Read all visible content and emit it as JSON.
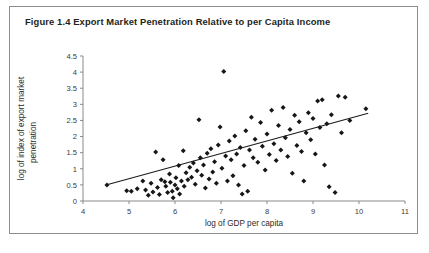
{
  "figure": {
    "title": "Figure 1.4  Export Market Penetration Relative to per Capita Income",
    "border_color": "#8d8d8d",
    "background": "#ffffff"
  },
  "chart_data": {
    "type": "scatter",
    "title": "Export Market Penetration Relative to per Capita Income",
    "xlabel": "log of GDP per capita",
    "ylabel": "log of index of export market penetration",
    "ylabel_line1": "log of index of export market",
    "ylabel_line2": "penetration",
    "xlim": [
      4,
      11
    ],
    "ylim": [
      0,
      4.5
    ],
    "xticks": [
      4,
      5,
      6,
      7,
      8,
      9,
      10,
      11
    ],
    "xtick_labels": [
      "4",
      "5",
      "6",
      "7",
      "8",
      "9",
      "10",
      "11"
    ],
    "yticks": [
      0,
      0.5,
      1,
      1.5,
      2,
      2.5,
      3,
      3.5,
      4,
      4.5
    ],
    "ytick_labels": [
      "0",
      "0.5",
      "1",
      "1.5",
      "2",
      "2.5",
      "3",
      "3.5",
      "4",
      "4.5"
    ],
    "grid": false,
    "legend": null,
    "marker": "diamond",
    "marker_color": "#161616",
    "trendline": {
      "type": "linear-fit",
      "x": [
        4.5,
        10.2
      ],
      "y": [
        0.5,
        2.72
      ],
      "color": "#1b1b1b"
    },
    "points": [
      [
        4.52,
        0.5
      ],
      [
        4.95,
        0.32
      ],
      [
        5.05,
        0.3
      ],
      [
        5.18,
        0.38
      ],
      [
        5.3,
        0.62
      ],
      [
        5.36,
        0.34
      ],
      [
        5.42,
        0.18
      ],
      [
        5.48,
        0.55
      ],
      [
        5.52,
        0.28
      ],
      [
        5.58,
        1.52
      ],
      [
        5.62,
        0.42
      ],
      [
        5.66,
        0.2
      ],
      [
        5.7,
        0.66
      ],
      [
        5.74,
        1.28
      ],
      [
        5.78,
        0.6
      ],
      [
        5.8,
        0.46
      ],
      [
        5.84,
        0.26
      ],
      [
        5.88,
        0.84
      ],
      [
        5.9,
        0.58
      ],
      [
        5.94,
        0.3
      ],
      [
        5.96,
        0.1
      ],
      [
        6.0,
        0.5
      ],
      [
        6.02,
        0.72
      ],
      [
        6.05,
        0.38
      ],
      [
        6.08,
        1.1
      ],
      [
        6.1,
        0.22
      ],
      [
        6.14,
        0.62
      ],
      [
        6.18,
        1.56
      ],
      [
        6.2,
        0.46
      ],
      [
        6.24,
        0.88
      ],
      [
        6.28,
        0.66
      ],
      [
        6.32,
        1.05
      ],
      [
        6.36,
        0.74
      ],
      [
        6.4,
        1.18
      ],
      [
        6.44,
        0.52
      ],
      [
        6.48,
        0.94
      ],
      [
        6.52,
        2.52
      ],
      [
        6.55,
        1.34
      ],
      [
        6.58,
        0.8
      ],
      [
        6.62,
        1.12
      ],
      [
        6.66,
        0.4
      ],
      [
        6.7,
        1.48
      ],
      [
        6.74,
        0.68
      ],
      [
        6.78,
        1.62
      ],
      [
        6.82,
        0.9
      ],
      [
        6.86,
        1.22
      ],
      [
        6.9,
        0.55
      ],
      [
        6.94,
        1.74
      ],
      [
        6.98,
        2.3
      ],
      [
        7.02,
        1.02
      ],
      [
        7.06,
        4.02
      ],
      [
        7.1,
        1.4
      ],
      [
        7.14,
        0.62
      ],
      [
        7.18,
        1.86
      ],
      [
        7.22,
        1.28
      ],
      [
        7.26,
        0.78
      ],
      [
        7.3,
        2.02
      ],
      [
        7.34,
        1.46
      ],
      [
        7.38,
        0.5
      ],
      [
        7.42,
        1.66
      ],
      [
        7.46,
        0.22
      ],
      [
        7.5,
        1.1
      ],
      [
        7.54,
        2.18
      ],
      [
        7.58,
        0.3
      ],
      [
        7.62,
        1.58
      ],
      [
        7.66,
        2.6
      ],
      [
        7.7,
        1.34
      ],
      [
        7.74,
        1.92
      ],
      [
        7.8,
        1.2
      ],
      [
        7.86,
        2.44
      ],
      [
        7.9,
        1.7
      ],
      [
        7.96,
        0.96
      ],
      [
        8.0,
        2.08
      ],
      [
        8.05,
        1.44
      ],
      [
        8.1,
        2.82
      ],
      [
        8.15,
        1.78
      ],
      [
        8.2,
        1.26
      ],
      [
        8.25,
        2.34
      ],
      [
        8.3,
        1.58
      ],
      [
        8.35,
        2.9
      ],
      [
        8.4,
        1.96
      ],
      [
        8.45,
        1.38
      ],
      [
        8.5,
        2.22
      ],
      [
        8.55,
        0.86
      ],
      [
        8.6,
        2.66
      ],
      [
        8.65,
        1.72
      ],
      [
        8.7,
        2.46
      ],
      [
        8.75,
        1.54
      ],
      [
        8.8,
        0.62
      ],
      [
        8.85,
        2.12
      ],
      [
        8.9,
        2.74
      ],
      [
        8.95,
        1.9
      ],
      [
        9.0,
        2.56
      ],
      [
        9.05,
        1.46
      ],
      [
        9.1,
        3.1
      ],
      [
        9.15,
        2.28
      ],
      [
        9.2,
        3.14
      ],
      [
        9.25,
        1.12
      ],
      [
        9.3,
        2.4
      ],
      [
        9.35,
        0.44
      ],
      [
        9.4,
        2.68
      ],
      [
        9.48,
        0.26
      ],
      [
        9.55,
        3.26
      ],
      [
        9.62,
        2.12
      ],
      [
        9.7,
        3.22
      ],
      [
        9.8,
        2.5
      ],
      [
        10.15,
        2.86
      ]
    ]
  }
}
